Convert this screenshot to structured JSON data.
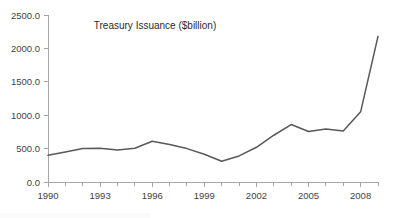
{
  "chart_data": {
    "type": "line",
    "title": "Treasury Issuance ($billion)",
    "xlabel": "",
    "ylabel": "",
    "x": [
      1990,
      1991,
      1992,
      1993,
      1994,
      1995,
      1996,
      1997,
      1998,
      1999,
      2000,
      2001,
      2002,
      2003,
      2004,
      2005,
      2006,
      2007,
      2008,
      2009
    ],
    "values": [
      400,
      450,
      500,
      505,
      480,
      505,
      610,
      560,
      500,
      415,
      310,
      390,
      520,
      700,
      860,
      755,
      795,
      765,
      1050,
      2180
    ],
    "series": [
      {
        "name": "Treasury Issuance",
        "values": [
          400,
          450,
          500,
          505,
          480,
          505,
          610,
          560,
          500,
          415,
          310,
          390,
          520,
          700,
          860,
          755,
          795,
          765,
          1050,
          2180
        ]
      }
    ],
    "xlim": [
      1990,
      2009
    ],
    "ylim": [
      0,
      2500
    ],
    "y_ticks": [
      0,
      500,
      1000,
      1500,
      2000,
      2500
    ],
    "y_tick_labels": [
      "0.0",
      "500.0",
      "1000.0",
      "1500.0",
      "2000.0",
      "2500.0"
    ],
    "x_ticks": [
      1990,
      1993,
      1996,
      1999,
      2002,
      2005,
      2008
    ],
    "x_tick_labels": [
      "1990",
      "1993",
      "1996",
      "1999",
      "2002",
      "2005",
      "2008"
    ],
    "x_minor_tick_interval": 1,
    "grid": false,
    "legend": false,
    "legend_position": "none",
    "line_color": "#595959",
    "axis_color": "#a6a6a6",
    "tick_label_color": "#3f3f3f",
    "title_color": "#2b2b2b",
    "background_color": "#ffffff"
  },
  "plot_geometry": {
    "left": 48,
    "right": 378,
    "top": 15,
    "bottom": 182,
    "title_x": 155,
    "title_y": 29
  }
}
